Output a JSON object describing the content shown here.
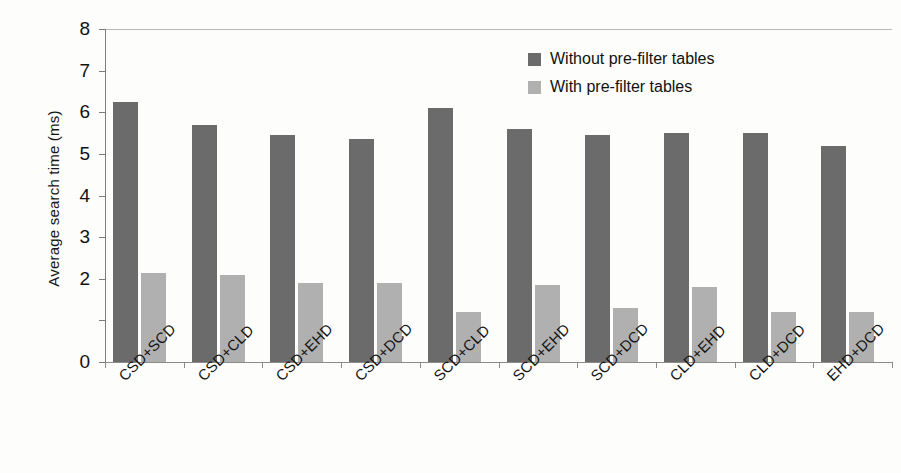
{
  "chart_data": {
    "type": "bar",
    "title": "",
    "xlabel": "",
    "ylabel": "Average search time  (ms)",
    "ylim": [
      0,
      8
    ],
    "yticks": [
      0,
      1,
      2,
      3,
      4,
      5,
      6,
      7,
      8
    ],
    "ytick_labels": [
      "0",
      "",
      "2",
      "3",
      "4",
      "5",
      "6",
      "7",
      "8"
    ],
    "grid": false,
    "legend_position": "top-right",
    "categories": [
      "CSD+SCD",
      "CSD+CLD",
      "CSD+EHD",
      "CSD+DCD",
      "SCD+CLD",
      "SCD+EHD",
      "SCD+DCD",
      "CLD+EHD",
      "CLD+DCD",
      "EHD+DCD"
    ],
    "series": [
      {
        "name": "Without pre-filter tables",
        "color": "#6b6b6b",
        "values": [
          6.25,
          5.7,
          5.45,
          5.35,
          6.1,
          5.6,
          5.45,
          5.5,
          5.5,
          5.2
        ]
      },
      {
        "name": "With pre-filter tables",
        "color": "#b0b0b0",
        "values": [
          2.15,
          2.1,
          1.9,
          1.9,
          1.2,
          1.85,
          1.3,
          1.8,
          1.2,
          1.2
        ]
      }
    ]
  },
  "legend": {
    "items": [
      {
        "label": "Without pre-filter tables",
        "swatch": "dark-gray-swatch"
      },
      {
        "label": "With pre-filter tables",
        "swatch": "light-gray-swatch"
      }
    ]
  }
}
